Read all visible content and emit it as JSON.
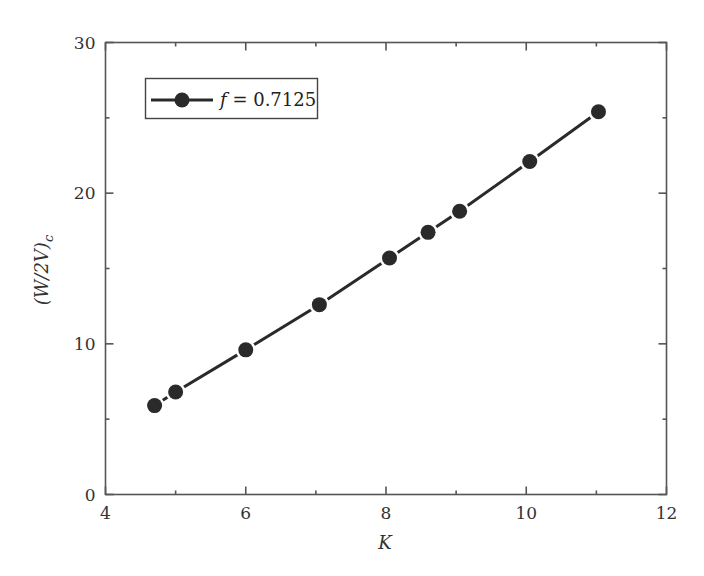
{
  "chart_data": {
    "type": "line",
    "title": "",
    "xlabel": "K",
    "ylabel": "(W/2V)",
    "ylabel_subscript": "c",
    "xlim": [
      4,
      12
    ],
    "ylim": [
      0,
      30
    ],
    "x_major_ticks": [
      4,
      6,
      8,
      10,
      12
    ],
    "x_minor_ticks": [
      5,
      7,
      9,
      11
    ],
    "y_major_ticks": [
      0,
      10,
      20,
      30
    ],
    "y_minor_ticks": [
      5,
      15,
      25
    ],
    "x_tick_labels": [
      "4",
      "6",
      "8",
      "10",
      "12"
    ],
    "y_tick_labels": [
      "0",
      "10",
      "20",
      "30"
    ],
    "grid": false,
    "legend_position": "upper left",
    "series": [
      {
        "name": "f = 0.7125",
        "legend_italic_part": "f",
        "legend_rest": " = 0.7125",
        "marker": "circle",
        "color": "#2a2a2a",
        "x": [
          4.7,
          5.0,
          6.0,
          7.05,
          8.05,
          8.6,
          9.05,
          10.05,
          11.03
        ],
        "y": [
          5.9,
          6.8,
          9.6,
          12.6,
          15.7,
          17.4,
          18.8,
          22.1,
          25.4
        ]
      }
    ]
  }
}
